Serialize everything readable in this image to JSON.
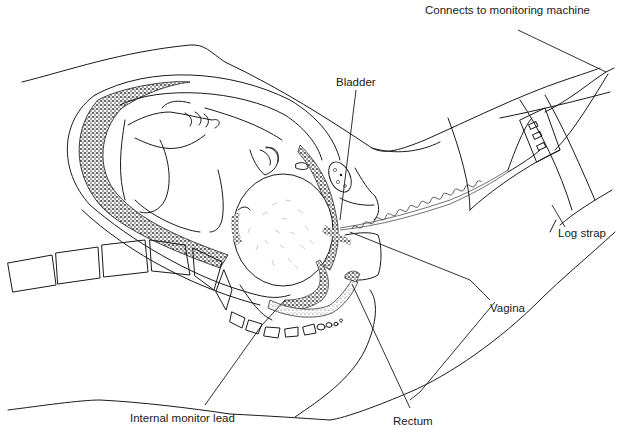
{
  "figure": {
    "background": "#ffffff",
    "ink_color": "#1a1a1a",
    "labels": [
      {
        "id": "monitoring-machine",
        "text": "Connects to monitoring machine",
        "x": 425,
        "y": 5
      },
      {
        "id": "bladder",
        "text": "Bladder",
        "x": 336,
        "y": 77
      },
      {
        "id": "log-strap",
        "text": "Log strap",
        "x": 558,
        "y": 228
      },
      {
        "id": "vagina",
        "text": "Vagina",
        "x": 490,
        "y": 303
      },
      {
        "id": "internal-monitor-lead",
        "text": "Internal monitor lead",
        "x": 130,
        "y": 413
      },
      {
        "id": "rectum",
        "text": "Rectum",
        "x": 393,
        "y": 416
      }
    ]
  }
}
